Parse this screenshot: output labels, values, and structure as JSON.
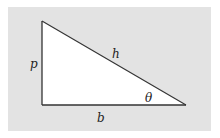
{
  "diagram": {
    "type": "right-triangle",
    "labels": {
      "perpendicular": "p",
      "hypotenuse": "h",
      "base": "b",
      "angle": "θ"
    },
    "colors": {
      "background_panel": "#e3e3e3",
      "triangle_fill": "#ffffff",
      "stroke": "#333333"
    }
  }
}
